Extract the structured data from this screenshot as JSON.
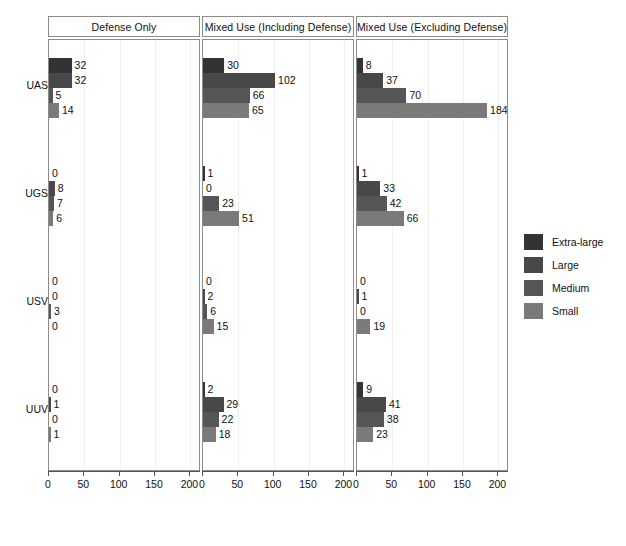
{
  "chart_data": {
    "type": "bar",
    "orientation": "horizontal",
    "title": "",
    "xlabel": "",
    "ylabel": "",
    "xlim": [
      0,
      215
    ],
    "xticks": [
      0,
      50,
      100,
      150,
      200
    ],
    "xtick_labels": [
      "0",
      "50",
      "100",
      "150",
      "200"
    ],
    "grid": true,
    "legend_position": "right",
    "categories": [
      "UAS",
      "UGS",
      "USV",
      "UUV"
    ],
    "size_classes": [
      "Extra-large",
      "Large",
      "Medium",
      "Small"
    ],
    "panels": [
      {
        "title": "Defense Only",
        "groups": [
          {
            "category": "UAS",
            "values": [
              32,
              32,
              5,
              14
            ]
          },
          {
            "category": "UGS",
            "values": [
              0,
              8,
              7,
              6
            ]
          },
          {
            "category": "USV",
            "values": [
              0,
              0,
              3,
              0
            ]
          },
          {
            "category": "UUV",
            "values": [
              0,
              1,
              0,
              1
            ]
          }
        ]
      },
      {
        "title": "Mixed Use (Including Defense)",
        "groups": [
          {
            "category": "UAS",
            "values": [
              30,
              102,
              66,
              65
            ]
          },
          {
            "category": "UGS",
            "values": [
              1,
              0,
              23,
              51
            ]
          },
          {
            "category": "USV",
            "values": [
              0,
              2,
              6,
              15
            ]
          },
          {
            "category": "UUV",
            "values": [
              2,
              29,
              22,
              18
            ]
          }
        ]
      },
      {
        "title": "Mixed Use (Excluding Defense)",
        "groups": [
          {
            "category": "UAS",
            "values": [
              8,
              37,
              70,
              184
            ]
          },
          {
            "category": "UGS",
            "values": [
              1,
              33,
              42,
              66
            ]
          },
          {
            "category": "USV",
            "values": [
              0,
              1,
              0,
              19
            ]
          },
          {
            "category": "UUV",
            "values": [
              9,
              41,
              38,
              23
            ]
          }
        ]
      }
    ]
  },
  "legend": {
    "items": [
      {
        "label": "Extra-large",
        "color": "#333333"
      },
      {
        "label": "Large",
        "color": "#484848"
      },
      {
        "label": "Medium",
        "color": "#565656"
      },
      {
        "label": "Small",
        "color": "#7a7a7a"
      }
    ]
  },
  "colors": {
    "extra_large": "#333333",
    "large": "#484848",
    "medium": "#565656",
    "small": "#7a7a7a",
    "panel_border": "#8c8c8c",
    "axis": "#555555",
    "gridline": "#efefef",
    "background": "#ffffff"
  }
}
